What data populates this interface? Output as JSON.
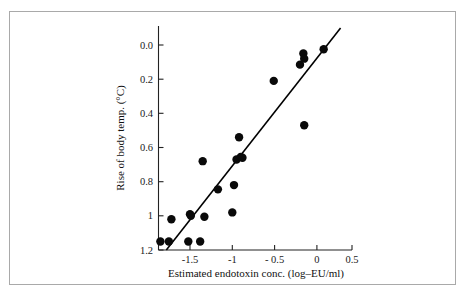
{
  "figure": {
    "background_color": "#ffffff",
    "frame_color": "#a9a9a9",
    "axis_color": "#222222",
    "point_color": "#0a0a0a",
    "line_color": "#000000"
  },
  "chart_data": {
    "type": "scatter",
    "title": "",
    "subtitle": "",
    "xlabel": "Estimated endotoxin conc. (log–EU/ml)",
    "ylabel": "Rise of body temp. (°C)",
    "xlim": [
      -1.95,
      0.62
    ],
    "ylim": [
      -0.02,
      1.32
    ],
    "xticks": [
      -1.5,
      -1,
      -0.5,
      0,
      0.5
    ],
    "xtick_labels": [
      "-1.5",
      "-1",
      "- 0.5",
      "0",
      "0.5"
    ],
    "yticks": [
      0.0,
      0.2,
      0.4,
      0.6,
      0.8,
      1.0,
      1.2
    ],
    "ytick_labels": [
      "0.0",
      "0.2",
      "0.4",
      "0.6",
      "0.8",
      "1",
      "1.2"
    ],
    "grid": false,
    "legend": null,
    "legend_position": "none",
    "x": [
      -1.85,
      -1.75,
      -1.72,
      -1.52,
      -1.5,
      -1.49,
      -1.38,
      -1.35,
      -1.33,
      -1.17,
      -1.0,
      -0.98,
      -0.95,
      -0.92,
      -0.9,
      -0.88,
      -0.51,
      -0.2,
      -0.16,
      -0.15,
      -0.15,
      0.08
    ],
    "y": [
      0.05,
      0.05,
      0.18,
      0.05,
      0.21,
      0.2,
      0.05,
      0.52,
      0.195,
      0.355,
      0.22,
      0.38,
      0.53,
      0.66,
      0.545,
      0.54,
      0.99,
      1.085,
      1.15,
      1.12,
      0.73,
      1.175
    ],
    "series": [
      {
        "name": "observations",
        "marker": "filled-circle",
        "marker_size_px": 4.2,
        "color": "#0a0a0a",
        "points": [
          {
            "x": -1.85,
            "y": 0.05
          },
          {
            "x": -1.75,
            "y": 0.05
          },
          {
            "x": -1.72,
            "y": 0.18
          },
          {
            "x": -1.52,
            "y": 0.05
          },
          {
            "x": -1.5,
            "y": 0.21
          },
          {
            "x": -1.49,
            "y": 0.2
          },
          {
            "x": -1.38,
            "y": 0.05
          },
          {
            "x": -1.35,
            "y": 0.52
          },
          {
            "x": -1.33,
            "y": 0.195
          },
          {
            "x": -1.17,
            "y": 0.355
          },
          {
            "x": -1.0,
            "y": 0.22
          },
          {
            "x": -0.98,
            "y": 0.38
          },
          {
            "x": -0.95,
            "y": 0.53
          },
          {
            "x": -0.92,
            "y": 0.66
          },
          {
            "x": -0.9,
            "y": 0.545
          },
          {
            "x": -0.88,
            "y": 0.54
          },
          {
            "x": -0.51,
            "y": 0.99
          },
          {
            "x": -0.2,
            "y": 1.085
          },
          {
            "x": -0.16,
            "y": 1.15
          },
          {
            "x": -0.15,
            "y": 1.12
          },
          {
            "x": -0.15,
            "y": 0.73
          },
          {
            "x": 0.08,
            "y": 1.175
          }
        ]
      }
    ],
    "fit_line": {
      "name": "regression-line",
      "type": "linear",
      "x_start": -1.78,
      "y_start": 0.0,
      "x_end": 0.28,
      "y_end": 1.3,
      "color": "#000000"
    }
  }
}
